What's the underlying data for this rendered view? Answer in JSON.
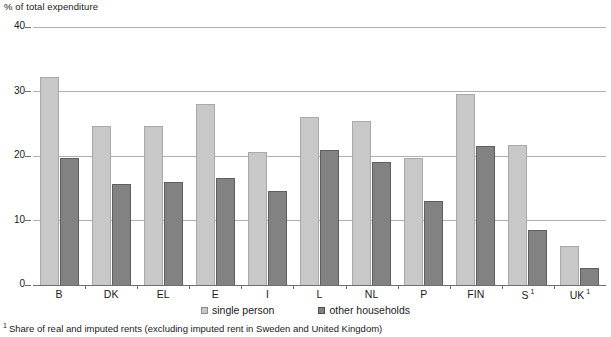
{
  "chart_data": {
    "type": "bar",
    "title": "",
    "ylabel": "% of total expenditure",
    "xlabel": "",
    "ylim": [
      0,
      40
    ],
    "yticks": [
      0,
      10,
      20,
      30,
      40
    ],
    "grid": true,
    "legend_position": "bottom-center",
    "categories": [
      "B",
      "DK",
      "EL",
      "E",
      "I",
      "L",
      "NL",
      "P",
      "FIN",
      "S",
      "UK"
    ],
    "category_footnote_marks": {
      "S": "1",
      "UK": "1"
    },
    "series": [
      {
        "name": "single person",
        "color": "#c8c8c8",
        "values": [
          32.2,
          24.6,
          24.6,
          28.0,
          20.7,
          26.1,
          25.4,
          19.7,
          29.6,
          21.7,
          6.0
        ]
      },
      {
        "name": "other households",
        "color": "#828282",
        "values": [
          19.7,
          15.6,
          16.0,
          16.6,
          14.6,
          21.0,
          19.0,
          13.0,
          21.6,
          8.5,
          2.7
        ]
      }
    ],
    "footnote": "Share of real and imputed rents (excluding imputed rent in Sweden and United Kingdom)",
    "footnote_mark": "1"
  }
}
